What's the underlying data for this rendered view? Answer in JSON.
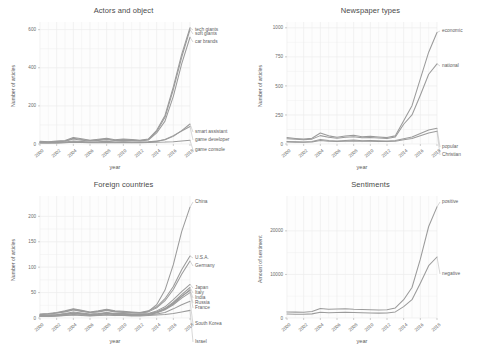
{
  "figure": {
    "background": "#ffffff",
    "line_color": "#9b9b9b",
    "text_color": "#4d4d4d"
  },
  "chart_data": [
    {
      "type": "line",
      "title": "Actors and object",
      "xlabel": "year",
      "ylabel": "Number of articles",
      "grid": true,
      "legend_position": "right-inline-labels",
      "x": [
        2000,
        2001,
        2002,
        2003,
        2004,
        2005,
        2006,
        2007,
        2008,
        2009,
        2010,
        2011,
        2012,
        2013,
        2014,
        2015,
        2016,
        2017,
        2018
      ],
      "xticks": [
        "2000",
        "2002",
        "2004",
        "2006",
        "2008",
        "2010",
        "2012",
        "2014",
        "2016",
        "2018"
      ],
      "yticks": [
        0,
        200,
        400,
        600
      ],
      "xlim": [
        2000,
        2018
      ],
      "ylim": [
        0,
        640
      ],
      "series": [
        {
          "name": "tech giants",
          "values": [
            14,
            12,
            15,
            18,
            34,
            27,
            20,
            25,
            30,
            22,
            26,
            24,
            20,
            26,
            72,
            150,
            300,
            470,
            610
          ]
        },
        {
          "name": "soft giants",
          "values": [
            12,
            10,
            13,
            16,
            30,
            24,
            18,
            22,
            26,
            20,
            23,
            21,
            18,
            24,
            66,
            140,
            286,
            455,
            600
          ]
        },
        {
          "name": "car brands",
          "values": [
            10,
            9,
            11,
            14,
            26,
            20,
            16,
            19,
            23,
            18,
            20,
            19,
            16,
            21,
            58,
            120,
            250,
            420,
            560
          ]
        },
        {
          "name": "smart assistant",
          "values": [
            6,
            5,
            6,
            8,
            12,
            10,
            8,
            9,
            11,
            9,
            10,
            9,
            8,
            10,
            14,
            22,
            40,
            70,
            105
          ]
        },
        {
          "name": "game developer",
          "values": [
            8,
            7,
            9,
            11,
            16,
            13,
            10,
            12,
            14,
            11,
            12,
            11,
            10,
            12,
            15,
            24,
            44,
            68,
            92
          ]
        },
        {
          "name": "game console",
          "values": [
            5,
            5,
            6,
            7,
            9,
            8,
            7,
            7,
            8,
            7,
            8,
            7,
            7,
            8,
            9,
            10,
            12,
            16,
            20
          ]
        }
      ]
    },
    {
      "type": "line",
      "title": "Newspaper types",
      "xlabel": "year",
      "ylabel": "Number of articles",
      "grid": true,
      "legend_position": "right-inline-labels",
      "x": [
        2000,
        2001,
        2002,
        2003,
        2004,
        2005,
        2006,
        2007,
        2008,
        2009,
        2010,
        2011,
        2012,
        2013,
        2014,
        2015,
        2016,
        2017,
        2018
      ],
      "xticks": [
        "2000",
        "2002",
        "2004",
        "2006",
        "2008",
        "2010",
        "2012",
        "2014",
        "2016",
        "2018"
      ],
      "yticks": [
        0,
        250,
        500,
        750,
        1000
      ],
      "xlim": [
        2000,
        2018
      ],
      "ylim": [
        0,
        1050
      ],
      "series": [
        {
          "name": "economic",
          "values": [
            55,
            48,
            42,
            50,
            95,
            70,
            58,
            68,
            75,
            62,
            66,
            60,
            55,
            70,
            200,
            330,
            560,
            790,
            960
          ]
        },
        {
          "name": "national",
          "values": [
            45,
            40,
            36,
            42,
            72,
            58,
            50,
            58,
            62,
            54,
            56,
            52,
            48,
            60,
            170,
            250,
            420,
            600,
            690
          ]
        },
        {
          "name": "popular",
          "values": [
            22,
            20,
            18,
            22,
            38,
            30,
            26,
            30,
            34,
            28,
            30,
            28,
            26,
            30,
            45,
            60,
            90,
            120,
            135
          ]
        },
        {
          "name": "Christian",
          "values": [
            18,
            16,
            15,
            18,
            30,
            24,
            21,
            24,
            27,
            23,
            24,
            22,
            21,
            24,
            36,
            48,
            72,
            95,
            110
          ]
        }
      ]
    },
    {
      "type": "line",
      "title": "Foreign countries",
      "xlabel": "year",
      "ylabel": "Number of articles",
      "grid": true,
      "legend_position": "right-inline-labels",
      "x": [
        2000,
        2001,
        2002,
        2003,
        2004,
        2005,
        2006,
        2007,
        2008,
        2009,
        2010,
        2011,
        2012,
        2013,
        2014,
        2015,
        2016,
        2017,
        2018
      ],
      "xticks": [
        "2000",
        "2002",
        "2004",
        "2006",
        "2008",
        "2010",
        "2012",
        "2014",
        "2016",
        "2018"
      ],
      "yticks": [
        0,
        50,
        100,
        150,
        200
      ],
      "xlim": [
        2000,
        2018
      ],
      "ylim": [
        0,
        240
      ],
      "series": [
        {
          "name": "China",
          "values": [
            7,
            8,
            10,
            13,
            17,
            14,
            11,
            13,
            16,
            13,
            12,
            11,
            10,
            13,
            26,
            55,
            105,
            170,
            218
          ]
        },
        {
          "name": "U.S.A.",
          "values": [
            8,
            9,
            11,
            14,
            18,
            15,
            12,
            14,
            17,
            14,
            13,
            12,
            11,
            14,
            22,
            38,
            62,
            95,
            122
          ]
        },
        {
          "name": "Germany",
          "values": [
            7,
            8,
            10,
            12,
            16,
            13,
            11,
            12,
            15,
            12,
            11,
            10,
            10,
            12,
            20,
            34,
            56,
            86,
            112
          ]
        },
        {
          "name": "Japan",
          "values": [
            5,
            6,
            7,
            9,
            12,
            10,
            8,
            9,
            11,
            9,
            9,
            8,
            8,
            9,
            14,
            22,
            36,
            52,
            66
          ]
        },
        {
          "name": "Italy",
          "values": [
            4,
            5,
            6,
            8,
            10,
            9,
            7,
            8,
            10,
            8,
            8,
            7,
            7,
            8,
            12,
            19,
            31,
            46,
            60
          ]
        },
        {
          "name": "India",
          "values": [
            4,
            4,
            5,
            7,
            9,
            8,
            6,
            7,
            9,
            7,
            7,
            6,
            6,
            7,
            11,
            17,
            28,
            42,
            56
          ]
        },
        {
          "name": "Russia",
          "values": [
            5,
            5,
            6,
            8,
            10,
            8,
            7,
            8,
            10,
            8,
            8,
            7,
            7,
            8,
            12,
            18,
            29,
            43,
            54
          ]
        },
        {
          "name": "France",
          "values": [
            4,
            4,
            5,
            7,
            9,
            8,
            6,
            7,
            9,
            7,
            7,
            6,
            6,
            7,
            10,
            16,
            26,
            39,
            50
          ]
        },
        {
          "name": "South Korea",
          "values": [
            3,
            3,
            4,
            5,
            7,
            6,
            5,
            5,
            7,
            5,
            5,
            5,
            5,
            6,
            8,
            11,
            18,
            26,
            33
          ]
        },
        {
          "name": "Israel",
          "values": [
            3,
            3,
            4,
            5,
            6,
            5,
            4,
            5,
            6,
            5,
            5,
            4,
            4,
            5,
            6,
            7,
            9,
            12,
            15
          ]
        }
      ]
    },
    {
      "type": "line",
      "title": "Sentiments",
      "xlabel": "year",
      "ylabel": "Amount of sentiment",
      "grid": true,
      "legend_position": "right-inline-labels",
      "x": [
        2000,
        2001,
        2002,
        2003,
        2004,
        2005,
        2006,
        2007,
        2008,
        2009,
        2010,
        2011,
        2012,
        2013,
        2014,
        2015,
        2016,
        2017,
        2018
      ],
      "xticks": [
        "2000",
        "2002",
        "2004",
        "2006",
        "2008",
        "2010",
        "2012",
        "2014",
        "2016",
        "2018"
      ],
      "yticks": [
        0,
        10000,
        20000
      ],
      "xlim": [
        2000,
        2018
      ],
      "ylim": [
        0,
        28000
      ],
      "series": [
        {
          "name": "positive",
          "values": [
            1400,
            1350,
            1300,
            1500,
            2200,
            2000,
            2050,
            2100,
            2000,
            1950,
            1900,
            1850,
            1900,
            2300,
            4200,
            7000,
            13500,
            21000,
            25500
          ]
        },
        {
          "name": "negative",
          "values": [
            900,
            880,
            850,
            950,
            1300,
            1200,
            1250,
            1300,
            1250,
            1200,
            1150,
            1120,
            1150,
            1400,
            2600,
            4200,
            8000,
            12000,
            14000
          ]
        }
      ]
    }
  ]
}
